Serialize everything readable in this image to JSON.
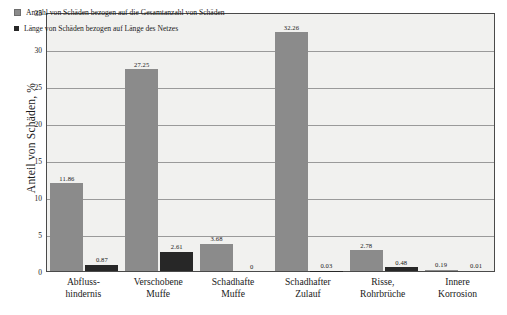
{
  "chart_data": {
    "type": "bar",
    "title": "",
    "xlabel": "",
    "ylabel": "Anteil von Schäden, %",
    "ylim": [
      0,
      35
    ],
    "yticks": [
      0,
      5,
      10,
      15,
      20,
      25,
      30,
      35
    ],
    "grid": true,
    "legend_position": "top-left",
    "categories": [
      "Abfluss-\nhindernis",
      "Verschobene\nMuffe",
      "Schadhafte\nMuffe",
      "Schadhafter\nZulauf",
      "Risse,\nRohrbrüche",
      "Innere\nKorrosion"
    ],
    "category_lines": [
      [
        "Abfluss-",
        "hindernis"
      ],
      [
        "Verschobene",
        "Muffe"
      ],
      [
        "Schadhafte",
        "Muffe"
      ],
      [
        "Schadhafter",
        "Zulauf"
      ],
      [
        "Risse,",
        "Rohrbrüche"
      ],
      [
        "Innere",
        "Korrosion"
      ]
    ],
    "series": [
      {
        "name": "Anzahl von Schäden bezogen auf die Gesamtanzahl von Schäden",
        "color": "#8b8b8b",
        "values": [
          11.86,
          27.25,
          3.68,
          32.26,
          2.78,
          0.19
        ],
        "labels": [
          "11.86",
          "27.25",
          "3.68",
          "32.26",
          "2.78",
          "0.19"
        ]
      },
      {
        "name": "Länge von Schäden bezogen auf Länge des Netzes",
        "color": "#272727",
        "values": [
          0.87,
          2.61,
          0,
          0.03,
          0.48,
          0.01
        ],
        "labels": [
          "0.87",
          "2.61",
          "0",
          "0.03",
          "0.48",
          "0.01"
        ]
      }
    ]
  },
  "legend": {
    "items": [
      {
        "label": "Anzahl von Schäden bezogen auf die Gesamtanzahl von Schäden",
        "swatch": "series-1-swatch"
      },
      {
        "label": "Länge von Schäden bezogen auf Länge des Netzes",
        "swatch": "series-2-swatch"
      }
    ]
  },
  "axes": {
    "y_title": "Anteil von Schäden, %",
    "y_tick_labels": [
      "0",
      "5",
      "10",
      "15",
      "20",
      "25",
      "30",
      "35"
    ]
  },
  "colors": {
    "series1": "#8b8b8b",
    "series2": "#272727",
    "plot_background": "#f1f1ef",
    "grid": "#9a9a9a",
    "axis_border": "#4a4a4a",
    "page_background": "#ffffff"
  }
}
